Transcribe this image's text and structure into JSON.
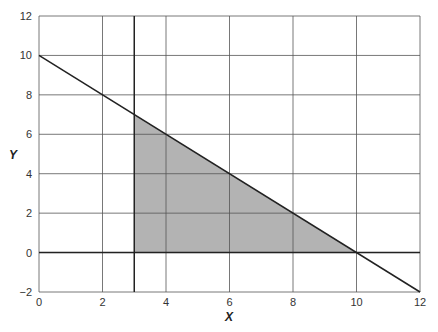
{
  "chart_data": {
    "type": "line",
    "title": "",
    "xlabel": "X",
    "ylabel": "Y",
    "xlim": [
      0,
      12
    ],
    "ylim": [
      -2,
      12
    ],
    "xticks": [
      0,
      2,
      4,
      6,
      8,
      10,
      12
    ],
    "yticks": [
      -2,
      0,
      2,
      4,
      6,
      8,
      10,
      12
    ],
    "grid": true,
    "grid_minor_x": [
      3
    ],
    "lines": [
      {
        "name": "x + y = 10",
        "points": [
          [
            0,
            10
          ],
          [
            12,
            -2
          ]
        ]
      },
      {
        "name": "x = 3",
        "points": [
          [
            3,
            -2
          ],
          [
            3,
            12
          ]
        ]
      },
      {
        "name": "y = 0",
        "points": [
          [
            0,
            0
          ],
          [
            12,
            0
          ]
        ]
      }
    ],
    "shaded_region": {
      "name": "feasible region",
      "vertices": [
        [
          3,
          0
        ],
        [
          3,
          7
        ],
        [
          10,
          0
        ]
      ],
      "color": "#b3b3b3"
    }
  },
  "colors": {
    "grid": "#555555",
    "line": "#222222",
    "fill": "#b3b3b3"
  }
}
